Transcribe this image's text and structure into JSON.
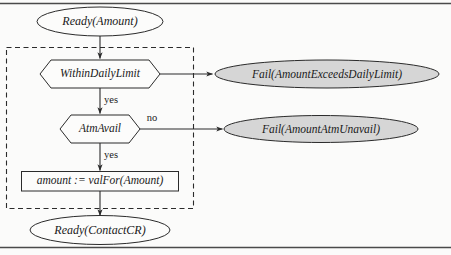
{
  "diagram": {
    "type": "flowchart",
    "title_text": "",
    "colors": {
      "terminal_fill": "#fcfcfb",
      "fail_fill": "#d6d6d6",
      "stroke": "#2b2b2b",
      "text": "#1a1a1a",
      "group_stroke": "#2b2b2b",
      "page_rule": "#4a4a4a",
      "background": "#fbfbfa"
    },
    "nodes": [
      {
        "id": "ready-amount",
        "shape": "ellipse",
        "label": "Ready(Amount)",
        "filled": false
      },
      {
        "id": "within-daily-limit",
        "shape": "hexagon",
        "label": "WithinDailyLimit",
        "filled": false
      },
      {
        "id": "fail-amount-exceeds-daily-limit",
        "shape": "ellipse",
        "label": "Fail(AmountExceedsDailyLimit)",
        "filled": true
      },
      {
        "id": "atm-avail",
        "shape": "hexagon",
        "label": "AtmAvail",
        "filled": false
      },
      {
        "id": "fail-amount-atm-unavail",
        "shape": "ellipse",
        "label": "Fail(AmountAtmUnavail)",
        "filled": true
      },
      {
        "id": "assignment",
        "shape": "rectangle",
        "label": "amount := valFor(Amount)",
        "filled": false
      },
      {
        "id": "ready-contact-cr",
        "shape": "ellipse",
        "label": "Ready(ContactCR)",
        "filled": false
      }
    ],
    "edges": [
      {
        "id": "e1",
        "from": "ready-amount",
        "to": "within-daily-limit",
        "label": ""
      },
      {
        "id": "e2",
        "from": "within-daily-limit",
        "to": "fail-amount-exceeds-daily-limit",
        "label": "no"
      },
      {
        "id": "e3",
        "from": "within-daily-limit",
        "to": "atm-avail",
        "label": "yes"
      },
      {
        "id": "e4",
        "from": "atm-avail",
        "to": "fail-amount-atm-unavail",
        "label": "no"
      },
      {
        "id": "e5",
        "from": "atm-avail",
        "to": "assignment",
        "label": "yes"
      },
      {
        "id": "e6",
        "from": "assignment",
        "to": "ready-contact-cr",
        "label": ""
      }
    ],
    "group_box": {
      "id": "dashed-group",
      "label": "",
      "style": "dashed"
    }
  }
}
